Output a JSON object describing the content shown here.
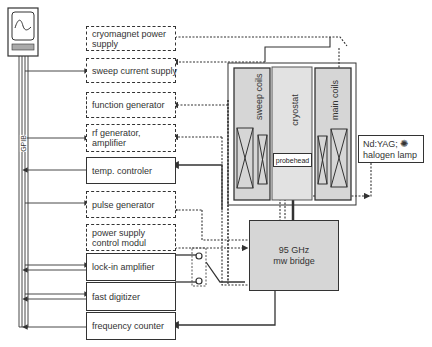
{
  "diagram": {
    "computer_label": "",
    "bus_label": "GPIB",
    "instruments": [
      {
        "id": "cryomagnet",
        "label": "cryomagnet power supply",
        "style": "dashed"
      },
      {
        "id": "sweep",
        "label": "sweep current supply",
        "style": "dashed"
      },
      {
        "id": "function",
        "label": "function generator",
        "style": "dashed"
      },
      {
        "id": "rf",
        "label": "rf generator, amplifier",
        "style": "dashed"
      },
      {
        "id": "temp",
        "label": "temp. controler",
        "style": "solid"
      },
      {
        "id": "pulse",
        "label": "pulse generator",
        "style": "dashed"
      },
      {
        "id": "psu",
        "label": "power supply control modul",
        "style": "dashed"
      },
      {
        "id": "lockin",
        "label": "lock-in amplifier",
        "style": "solid"
      },
      {
        "id": "digitizer",
        "label": "fast digitizer",
        "style": "solid"
      },
      {
        "id": "freq",
        "label": "frequency counter",
        "style": "solid"
      }
    ],
    "magnet": {
      "sweep_coils": "sweep coils",
      "cryostat": "cryostat",
      "main_coils": "main coils",
      "probehead": "probehead"
    },
    "bridge": {
      "line1": "95 GHz",
      "line2": "mw bridge"
    },
    "lamp": {
      "line1": "Nd:YAG;",
      "line2": "halogen lamp"
    },
    "colors": {
      "line": "#333333",
      "fill_gray": "#d6d6d6",
      "fill_light": "#e2e2e2"
    }
  }
}
